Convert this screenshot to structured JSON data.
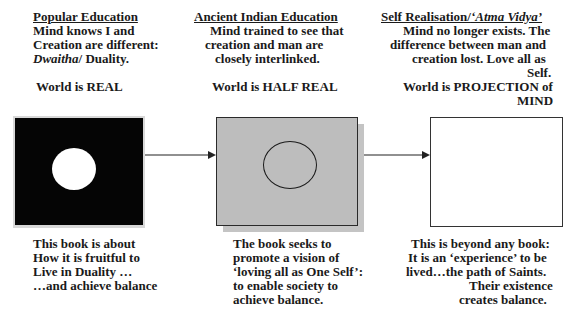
{
  "columns": [
    {
      "title": "Popular Education",
      "description_lines": [
        "Mind knows I and",
        "Creation are different:"
      ],
      "duality_line": {
        "italic": "Dwaitha",
        "rest": "/ Duality."
      },
      "world_statement": "World is REAL",
      "box": {
        "fill": "#050505",
        "circle_fill": "#ffffff",
        "circle_style": "solid"
      },
      "caption_lines": [
        "This book is about",
        "How it is fruitful to",
        "Live in Duality …",
        "…and achieve balance"
      ]
    },
    {
      "title": "Ancient Indian Education",
      "description_lines": [
        "Mind trained to see that",
        "creation and man are",
        "closely interlinked."
      ],
      "world_statement": "World is HALF REAL",
      "box": {
        "fill": "#bdbdbd",
        "circle_fill": "none",
        "circle_style": "outline",
        "shadow": true
      },
      "caption_lines": [
        "The book seeks to",
        "promote a vision of",
        "‘loving all as One Self’:",
        "to enable society to",
        "achieve balance."
      ]
    },
    {
      "title_plain": "Self Realisation/",
      "title_italic": "‘Atma Vidya’",
      "description_lines": [
        "Mind no longer exists. The",
        "difference between man and",
        "creation lost. Love all as",
        "Self."
      ],
      "world_statement_lines": [
        "World is PROJECTION of",
        "MIND"
      ],
      "box": {
        "fill": "#ffffff",
        "circle": false
      },
      "caption_lines": [
        "This is beyond any book:",
        "It is an ‘experience’ to be",
        "lived…the path of Saints.",
        "Their existence",
        "creates balance."
      ]
    }
  ],
  "arrows": [
    {
      "from": "Popular Education",
      "to": "Ancient Indian Education"
    },
    {
      "from": "Ancient Indian Education",
      "to": "Self Realisation"
    }
  ]
}
